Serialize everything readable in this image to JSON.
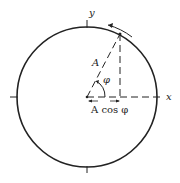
{
  "diagram": {
    "type": "phasor-reference-circle",
    "labels": {
      "x_axis": "x",
      "y_axis": "y",
      "amplitude": "A",
      "angle": "φ",
      "projection": "A cos φ"
    },
    "colors": {
      "stroke": "#222222",
      "background": "#ffffff"
    }
  }
}
